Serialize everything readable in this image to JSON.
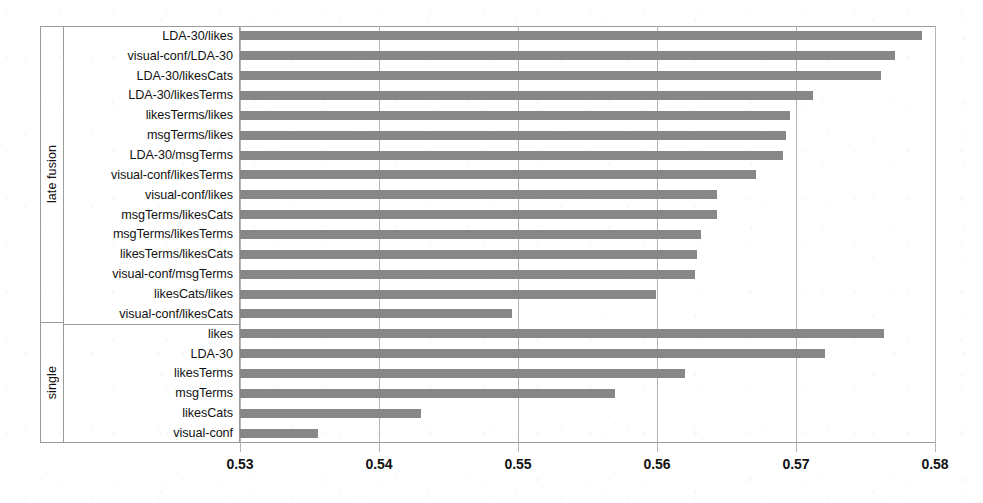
{
  "chart_data": {
    "type": "bar",
    "orientation": "horizontal",
    "title": "",
    "subtitle": "",
    "xlabel": "",
    "ylabel": "",
    "xlim": [
      0.53,
      0.58
    ],
    "xticks": [
      "0.53",
      "0.54",
      "0.55",
      "0.56",
      "0.57",
      "0.58"
    ],
    "xtick_values": [
      0.53,
      0.54,
      0.55,
      0.56,
      0.57,
      0.58
    ],
    "grid": true,
    "legend": null,
    "bar_color": "#878787",
    "groups": [
      {
        "name": "late fusion",
        "categories": [
          "LDA-30/likes",
          "visual-conf/LDA-30",
          "LDA-30/likesCats",
          "LDA-30/likesTerms",
          "likesTerms/likes",
          "msgTerms/likes",
          "LDA-30/msgTerms",
          "visual-conf/likesTerms",
          "visual-conf/likes",
          "msgTerms/likesCats",
          "msgTerms/likesTerms",
          "likesTerms/likesCats",
          "visual-conf/msgTerms",
          "likesCats/likes",
          "visual-conf/likesCats"
        ],
        "values": [
          0.5791,
          0.5771,
          0.5761,
          0.5712,
          0.5696,
          0.5693,
          0.5691,
          0.5671,
          0.5643,
          0.5643,
          0.5632,
          0.5629,
          0.5627,
          0.5599,
          0.5496
        ]
      },
      {
        "name": "single",
        "categories": [
          "likes",
          "LDA-30",
          "likesTerms",
          "msgTerms",
          "likesCats",
          "visual-conf"
        ],
        "values": [
          0.5763,
          0.5721,
          0.562,
          0.557,
          0.543,
          0.5356
        ]
      }
    ]
  }
}
